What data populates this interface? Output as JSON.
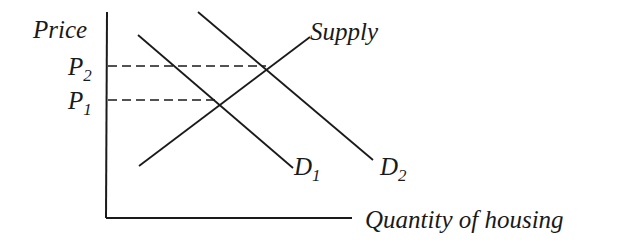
{
  "diagram": {
    "y_axis_label": "Price",
    "x_axis_label": "Quantity of housing",
    "price_labels": [
      {
        "main": "P",
        "sub": "2"
      },
      {
        "main": "P",
        "sub": "1"
      }
    ],
    "curves": {
      "supply": "Supply",
      "demand_1": {
        "main": "D",
        "sub": "1"
      },
      "demand_2": {
        "main": "D",
        "sub": "2"
      }
    },
    "colors": {
      "line": "#1a1a1a",
      "background": "#ffffff"
    }
  }
}
